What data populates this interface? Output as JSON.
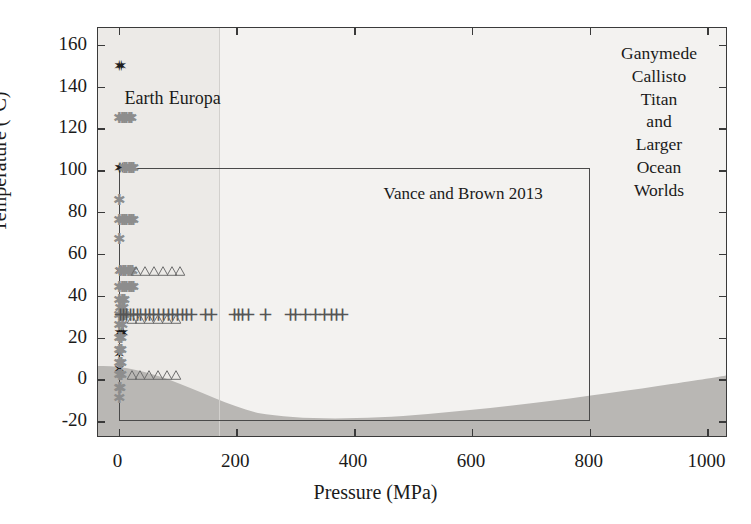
{
  "chart_data": {
    "type": "scatter",
    "title": "",
    "xlabel": "Pressure (MPa)",
    "ylabel": "Temperature (°C)",
    "xlim": [
      -35,
      1035
    ],
    "ylim": [
      -28,
      168
    ],
    "xticks": [
      0,
      200,
      400,
      600,
      800,
      1000
    ],
    "xtick_labels": [
      "0",
      "200",
      "400",
      "600",
      "800",
      "1000"
    ],
    "yticks": [
      -20,
      0,
      20,
      40,
      60,
      80,
      100,
      120,
      140,
      160
    ],
    "ytick_labels": [
      "-20",
      "0",
      "20",
      "40",
      "60",
      "80",
      "100",
      "120",
      "140",
      "160"
    ],
    "grid": false,
    "legend_position": "inline-labels",
    "series": [
      {
        "name": "Earth",
        "marker": "filled-star",
        "color": "#1d1d1d",
        "points": [
          [
            2,
            150
          ],
          [
            5,
            150
          ],
          [
            1,
            101
          ],
          [
            4,
            101
          ],
          [
            7,
            101
          ],
          [
            2,
            52
          ],
          [
            5,
            52
          ],
          [
            8,
            52
          ],
          [
            11,
            52
          ],
          [
            1,
            31
          ],
          [
            4,
            31
          ],
          [
            2,
            22
          ],
          [
            5,
            22
          ],
          [
            8,
            22
          ],
          [
            2,
            12
          ],
          [
            1,
            5
          ]
        ]
      },
      {
        "name": "Europa",
        "marker": "asterisk",
        "color": "#8d8d8d",
        "points": [
          [
            2,
            125
          ],
          [
            6,
            125
          ],
          [
            10,
            125
          ],
          [
            14,
            125
          ],
          [
            18,
            125
          ],
          [
            22,
            125
          ],
          [
            10,
            101
          ],
          [
            14,
            101
          ],
          [
            18,
            101
          ],
          [
            22,
            101
          ],
          [
            26,
            101
          ],
          [
            2,
            86
          ],
          [
            2,
            76
          ],
          [
            6,
            76
          ],
          [
            10,
            76
          ],
          [
            14,
            76
          ],
          [
            18,
            76
          ],
          [
            22,
            76
          ],
          [
            26,
            76
          ],
          [
            2,
            67
          ],
          [
            4,
            52
          ],
          [
            8,
            52
          ],
          [
            12,
            52
          ],
          [
            16,
            52
          ],
          [
            20,
            52
          ],
          [
            24,
            52
          ],
          [
            2,
            44
          ],
          [
            6,
            44
          ],
          [
            10,
            44
          ],
          [
            14,
            44
          ],
          [
            18,
            44
          ],
          [
            22,
            44
          ],
          [
            26,
            44
          ],
          [
            2,
            38
          ],
          [
            6,
            38
          ],
          [
            10,
            38
          ],
          [
            4,
            34
          ],
          [
            8,
            34
          ],
          [
            2,
            31
          ],
          [
            6,
            31
          ],
          [
            10,
            31
          ],
          [
            2,
            26
          ],
          [
            6,
            26
          ],
          [
            2,
            20
          ],
          [
            5,
            20
          ],
          [
            2,
            14
          ],
          [
            5,
            14
          ],
          [
            2,
            8
          ],
          [
            5,
            8
          ],
          [
            2,
            2
          ],
          [
            5,
            2
          ],
          [
            2,
            -4
          ],
          [
            4,
            -4
          ],
          [
            2,
            -9
          ]
        ]
      },
      {
        "name": "high-pressure-crosses",
        "marker": "plus",
        "color": "#555555",
        "points": [
          [
            3,
            31
          ],
          [
            8,
            31
          ],
          [
            14,
            31
          ],
          [
            20,
            31
          ],
          [
            26,
            31
          ],
          [
            32,
            31
          ],
          [
            38,
            31
          ],
          [
            45,
            31
          ],
          [
            52,
            31
          ],
          [
            60,
            31
          ],
          [
            68,
            31
          ],
          [
            76,
            31
          ],
          [
            84,
            31
          ],
          [
            92,
            31
          ],
          [
            100,
            31
          ],
          [
            108,
            31
          ],
          [
            116,
            31
          ],
          [
            124,
            31
          ],
          [
            148,
            31
          ],
          [
            158,
            31
          ],
          [
            196,
            31
          ],
          [
            203,
            31
          ],
          [
            210,
            31
          ],
          [
            220,
            31
          ],
          [
            250,
            31
          ],
          [
            292,
            31
          ],
          [
            300,
            31
          ],
          [
            318,
            31
          ],
          [
            334,
            31
          ],
          [
            350,
            31
          ],
          [
            362,
            31
          ],
          [
            370,
            31
          ],
          [
            380,
            31
          ]
        ]
      },
      {
        "name": "triangles-upper",
        "marker": "open-triangle",
        "color": "#6d6d6d",
        "points": [
          [
            30,
            52
          ],
          [
            45,
            52
          ],
          [
            60,
            52
          ],
          [
            75,
            52
          ],
          [
            90,
            52
          ],
          [
            105,
            52
          ]
        ]
      },
      {
        "name": "triangles-middle",
        "marker": "open-triangle",
        "color": "#6d6d6d",
        "points": [
          [
            22,
            29
          ],
          [
            37,
            29
          ],
          [
            52,
            29
          ],
          [
            67,
            29
          ],
          [
            82,
            29
          ],
          [
            97,
            29
          ]
        ]
      },
      {
        "name": "triangles-lower",
        "marker": "open-triangle",
        "color": "#6d6d6d",
        "points": [
          [
            22,
            2
          ],
          [
            37,
            2
          ],
          [
            52,
            2
          ],
          [
            67,
            2
          ],
          [
            82,
            2
          ],
          [
            97,
            2
          ]
        ]
      }
    ],
    "annotations": [
      {
        "name": "earth-label",
        "text": "Earth",
        "x": 10,
        "y": 134
      },
      {
        "name": "europa-label",
        "text": "Europa",
        "x": 85,
        "y": 134
      },
      {
        "name": "vance-box-label",
        "text": "Vance and Brown 2013",
        "x": 450,
        "y": 88
      }
    ],
    "regions": [
      {
        "name": "vance-and-brown-2013-box",
        "x_range": [
          0,
          800
        ],
        "y_range": [
          -20,
          101
        ]
      },
      {
        "name": "pressure-divider",
        "x": 170
      },
      {
        "name": "ice-melting-curve",
        "description": "dark shaded sub-freezing / high-pressure ice field below curve"
      }
    ]
  },
  "axes": {
    "xlabel": "Pressure (MPa)",
    "ylabel": "Temperature (°C)",
    "xtick_labels": [
      "0",
      "200",
      "400",
      "600",
      "800",
      "1000"
    ],
    "ytick_labels": [
      "-20",
      "0",
      "20",
      "40",
      "60",
      "80",
      "100",
      "120",
      "140",
      "160"
    ]
  },
  "labels": {
    "earth": "Earth",
    "europa": "Europa",
    "vance_box": "Vance and Brown 2013",
    "corner_lines": [
      "Ganymede",
      "Callisto",
      "Titan",
      "and",
      "Larger",
      "Ocean",
      "Worlds"
    ]
  }
}
